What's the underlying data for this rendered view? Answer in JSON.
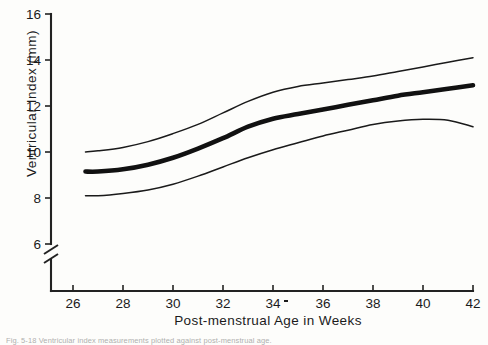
{
  "figure": {
    "caption": "Fig. 5-18  Ventricular index measurements plotted against post-menstrual age."
  },
  "chart_data": {
    "type": "line",
    "title": "",
    "xlabel": "Post-menstrual Age in Weeks",
    "ylabel": "Ventricular Index (mm)",
    "xlim": [
      25,
      42
    ],
    "ylim": [
      6,
      16
    ],
    "grid": false,
    "legend_position": "none",
    "axis_break": {
      "axis": "y",
      "below": 6,
      "symbol": "double-slash"
    },
    "xticks": [
      26,
      28,
      30,
      32,
      34,
      36,
      38,
      40,
      42
    ],
    "xtick_labels": [
      "26",
      "28",
      "30",
      "32",
      "34",
      "36",
      "38",
      "40",
      "42"
    ],
    "yticks": [
      6,
      8,
      10,
      12,
      14,
      16
    ],
    "ytick_labels": [
      "6",
      "8",
      "10",
      "12",
      "14",
      "16"
    ],
    "x": [
      26.5,
      27,
      28,
      29,
      30,
      31,
      32,
      33,
      34,
      35,
      36,
      37,
      38,
      39,
      40,
      41,
      42
    ],
    "series": [
      {
        "name": "upper",
        "style": "thin",
        "values": [
          10.0,
          10.05,
          10.2,
          10.45,
          10.8,
          11.2,
          11.7,
          12.2,
          12.6,
          12.85,
          13.0,
          13.15,
          13.3,
          13.5,
          13.7,
          13.9,
          14.1
        ]
      },
      {
        "name": "mean",
        "style": "thick",
        "values": [
          9.15,
          9.15,
          9.25,
          9.45,
          9.75,
          10.15,
          10.6,
          11.1,
          11.45,
          11.65,
          11.85,
          12.05,
          12.25,
          12.45,
          12.6,
          12.75,
          12.9
        ]
      },
      {
        "name": "lower",
        "style": "thin",
        "values": [
          8.1,
          8.1,
          8.2,
          8.35,
          8.6,
          8.95,
          9.35,
          9.75,
          10.1,
          10.4,
          10.7,
          10.95,
          11.2,
          11.35,
          11.42,
          11.38,
          11.1
        ]
      }
    ]
  }
}
